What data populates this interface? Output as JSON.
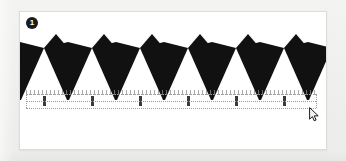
{
  "canvas": {
    "width": 346,
    "height": 161,
    "background_color": "#f1f1ef"
  },
  "artboard": {
    "name": "artboard",
    "background_color": "#ffffff",
    "border_color": "#dcdcdc",
    "x": 19,
    "y": 11,
    "width": 308,
    "height": 139
  },
  "badge": {
    "label": "1",
    "background_color": "#1b1b1b",
    "text_color": "#ffffff"
  },
  "artwork": {
    "name": "zigzag-spike-pattern",
    "fill_color": "#111111",
    "description": "Repeating black sawtooth border: large downward kite spikes alternating with small upward triangles",
    "repeat_count": 6,
    "tile_width": 48,
    "baseline_y": 88,
    "crest_y": 36,
    "peak_y": 22
  },
  "guides": {
    "line_color": "#9a9a9a",
    "style": "dotted",
    "top_y": 82,
    "mid_y": 89,
    "bottom_y": 96,
    "left_x": 6,
    "right_x": 296,
    "tick_spacing": 4
  },
  "cursor": {
    "name": "arrow-pointer",
    "x": 289,
    "y": 95,
    "fill": "#f2f2f2",
    "stroke": "#1a1a1a"
  }
}
